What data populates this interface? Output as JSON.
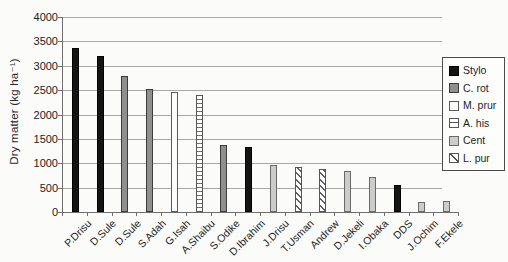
{
  "chart_data": {
    "type": "bar",
    "title": "",
    "xlabel": "",
    "ylabel": "Dry matter (kg ha⁻¹)",
    "ylim": [
      0,
      4000
    ],
    "grid": true,
    "yticks": [
      0,
      500,
      1000,
      1500,
      2000,
      2500,
      3000,
      3500,
      4000
    ],
    "categories": [
      "P.Drisu",
      "D.Sule",
      "D.Sule",
      "S.Adah",
      "G.Isah",
      "A.Shaibu",
      "S.Odike",
      "D.Ibrahim",
      "J.Drisu",
      "T.Usman",
      "Andrew",
      "D.Jekeli",
      "I.Obaka",
      "DDS",
      "J.Ochim",
      "F.Ekele"
    ],
    "values": [
      3370,
      3200,
      2780,
      2530,
      2460,
      2390,
      1370,
      1330,
      960,
      920,
      890,
      840,
      715,
      560,
      210,
      230
    ],
    "bar_series": [
      "Stylo",
      "Stylo",
      "C. rot",
      "C. rot",
      "M. prur",
      "A. his",
      "C. rot",
      "Stylo",
      "Cent",
      "L. pur",
      "L. pur",
      "Cent",
      "Cent",
      "Stylo",
      "Cent",
      "Cent"
    ],
    "legend": {
      "position": "right",
      "entries": [
        {
          "label": "Stylo",
          "pattern": "solid-black",
          "color": "#141414"
        },
        {
          "label": "C. rot",
          "pattern": "solid-darkgray",
          "color": "#8f8f8f"
        },
        {
          "label": "M. prur",
          "pattern": "solid-white",
          "color": "#ffffff"
        },
        {
          "label": "A. his",
          "pattern": "horizontal-stripes",
          "color": "#ffffff"
        },
        {
          "label": "Cent",
          "pattern": "solid-lightgray",
          "color": "#cccccb"
        },
        {
          "label": "L. pur",
          "pattern": "diagonal-stripes",
          "color": "#ffffff"
        }
      ]
    }
  }
}
